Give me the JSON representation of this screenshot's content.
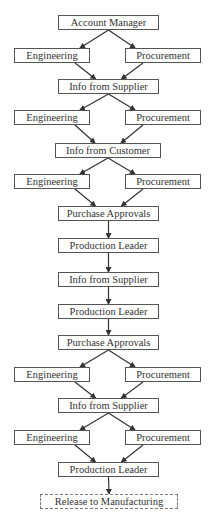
{
  "diagram": {
    "type": "flowchart",
    "colors": {
      "border": "#555555",
      "text": "#333333",
      "arrow": "#333333",
      "background": "#ffffff"
    },
    "nodes": [
      {
        "id": "n0",
        "label": "Account Manager",
        "x": 58,
        "y": 15,
        "w": 101,
        "style": "solid"
      },
      {
        "id": "n1",
        "label": "Engineering",
        "x": 14,
        "y": 48,
        "w": 76,
        "style": "solid"
      },
      {
        "id": "n2",
        "label": "Procurement",
        "x": 125,
        "y": 48,
        "w": 76,
        "style": "solid"
      },
      {
        "id": "n3",
        "label": "Info from Supplier",
        "x": 58,
        "y": 79,
        "w": 101,
        "style": "solid"
      },
      {
        "id": "n4",
        "label": "Engineering",
        "x": 14,
        "y": 110,
        "w": 76,
        "style": "solid"
      },
      {
        "id": "n5",
        "label": "Procurement",
        "x": 125,
        "y": 110,
        "w": 76,
        "style": "solid"
      },
      {
        "id": "n6",
        "label": "Info from Customer",
        "x": 55,
        "y": 143,
        "w": 106,
        "style": "solid"
      },
      {
        "id": "n7",
        "label": "Engineering",
        "x": 14,
        "y": 174,
        "w": 76,
        "style": "solid"
      },
      {
        "id": "n8",
        "label": "Procurement",
        "x": 125,
        "y": 174,
        "w": 76,
        "style": "solid"
      },
      {
        "id": "n9",
        "label": "Purchase Approvals",
        "x": 58,
        "y": 206,
        "w": 101,
        "style": "solid"
      },
      {
        "id": "n10",
        "label": "Production Leader",
        "x": 58,
        "y": 238,
        "w": 101,
        "style": "solid"
      },
      {
        "id": "n11",
        "label": "Info from Supplier",
        "x": 58,
        "y": 272,
        "w": 101,
        "style": "solid"
      },
      {
        "id": "n12",
        "label": "Production Leader",
        "x": 58,
        "y": 304,
        "w": 101,
        "style": "solid"
      },
      {
        "id": "n13",
        "label": "Purchase Approvals",
        "x": 58,
        "y": 335,
        "w": 101,
        "style": "solid"
      },
      {
        "id": "n14",
        "label": "Engineering",
        "x": 14,
        "y": 367,
        "w": 76,
        "style": "solid"
      },
      {
        "id": "n15",
        "label": "Procurement",
        "x": 125,
        "y": 367,
        "w": 76,
        "style": "solid"
      },
      {
        "id": "n16",
        "label": "Info from Supplier",
        "x": 58,
        "y": 398,
        "w": 101,
        "style": "solid"
      },
      {
        "id": "n17",
        "label": "Engineering",
        "x": 14,
        "y": 430,
        "w": 76,
        "style": "solid"
      },
      {
        "id": "n18",
        "label": "Procurement",
        "x": 125,
        "y": 430,
        "w": 76,
        "style": "solid"
      },
      {
        "id": "n19",
        "label": "Production Leader",
        "x": 58,
        "y": 462,
        "w": 101,
        "style": "solid"
      },
      {
        "id": "n20",
        "label": "Release to Manufacturing",
        "x": 40,
        "y": 494,
        "w": 138,
        "style": "dashed"
      }
    ],
    "edges": [
      [
        "n0",
        "n1"
      ],
      [
        "n0",
        "n2"
      ],
      [
        "n1",
        "n3"
      ],
      [
        "n2",
        "n3"
      ],
      [
        "n3",
        "n4"
      ],
      [
        "n3",
        "n5"
      ],
      [
        "n4",
        "n6"
      ],
      [
        "n5",
        "n6"
      ],
      [
        "n6",
        "n7"
      ],
      [
        "n6",
        "n8"
      ],
      [
        "n7",
        "n9"
      ],
      [
        "n8",
        "n9"
      ],
      [
        "n9",
        "n10"
      ],
      [
        "n10",
        "n11"
      ],
      [
        "n11",
        "n12"
      ],
      [
        "n12",
        "n13"
      ],
      [
        "n13",
        "n14"
      ],
      [
        "n13",
        "n15"
      ],
      [
        "n14",
        "n16"
      ],
      [
        "n15",
        "n16"
      ],
      [
        "n16",
        "n17"
      ],
      [
        "n16",
        "n18"
      ],
      [
        "n17",
        "n19"
      ],
      [
        "n18",
        "n19"
      ],
      [
        "n19",
        "n20"
      ]
    ]
  }
}
